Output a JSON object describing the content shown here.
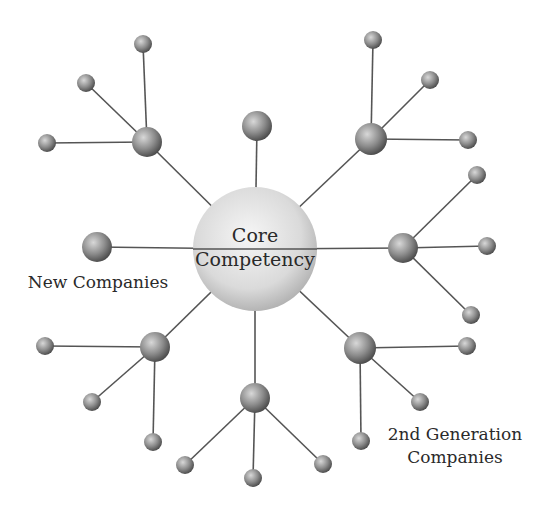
{
  "diagram": {
    "center": {
      "label_line1": "Core",
      "label_line2": "Competency",
      "x": 255,
      "y": 249,
      "r": 62
    },
    "hubs": [
      {
        "id": "upper-left",
        "x": 147,
        "y": 142,
        "r": 15,
        "satellites": [
          [
            143,
            44
          ],
          [
            86,
            83
          ],
          [
            47,
            143
          ]
        ]
      },
      {
        "id": "top",
        "x": 257,
        "y": 126,
        "r": 15,
        "satellites": []
      },
      {
        "id": "upper-right",
        "x": 371,
        "y": 139,
        "r": 16,
        "satellites": [
          [
            373,
            40
          ],
          [
            430,
            80
          ],
          [
            468,
            140
          ]
        ]
      },
      {
        "id": "right",
        "x": 403,
        "y": 248,
        "r": 15,
        "satellites": [
          [
            477,
            175
          ],
          [
            487,
            246
          ],
          [
            471,
            315
          ]
        ]
      },
      {
        "id": "lower-right",
        "x": 360,
        "y": 348,
        "r": 16,
        "satellites": [
          [
            467,
            346
          ],
          [
            420,
            402
          ],
          [
            361,
            441
          ]
        ]
      },
      {
        "id": "bottom",
        "x": 255,
        "y": 398,
        "r": 15,
        "satellites": [
          [
            185,
            465
          ],
          [
            253,
            478
          ],
          [
            323,
            464
          ]
        ]
      },
      {
        "id": "lower-left",
        "x": 155,
        "y": 347,
        "r": 15,
        "satellites": [
          [
            45,
            346
          ],
          [
            92,
            402
          ],
          [
            153,
            442
          ]
        ]
      },
      {
        "id": "left",
        "x": 97,
        "y": 247,
        "r": 15,
        "satellites": []
      }
    ],
    "satellite_radius": 9,
    "labels": {
      "new_companies": "New Companies",
      "second_gen_line1": "2nd Generation",
      "second_gen_line2": "Companies"
    },
    "colors": {
      "line": "#555555",
      "sphere_light": "#d4d4d4",
      "sphere_dark": "#4a4a4a",
      "core_light": "#f4f4f4",
      "core_dark": "#b4b4b4",
      "text": "#2a2a2a"
    }
  }
}
